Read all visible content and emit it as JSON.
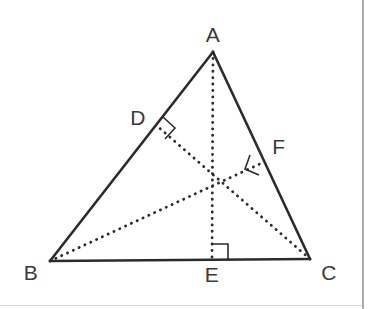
{
  "figure": {
    "background_color": "#ffffff",
    "stroke_color": "#2b2b2b",
    "label_color": "#3a3a3a",
    "border_color": "#8a8a8a"
  },
  "points": {
    "A": {
      "label": "A",
      "x": 213,
      "y": 52,
      "label_x": 213,
      "label_y": 34
    },
    "B": {
      "label": "B",
      "x": 50,
      "y": 261,
      "label_x": 31,
      "label_y": 272
    },
    "C": {
      "label": "C",
      "x": 310,
      "y": 259,
      "label_x": 329,
      "label_y": 272
    },
    "D": {
      "label": "D",
      "x": 156,
      "y": 125,
      "label_x": 138,
      "label_y": 117
    },
    "E": {
      "label": "E",
      "x": 212,
      "y": 260,
      "label_x": 212,
      "label_y": 274
    },
    "F": {
      "label": "F",
      "x": 264,
      "y": 162,
      "label_x": 279,
      "label_y": 146
    },
    "H": {
      "label": "",
      "x": 212,
      "y": 176
    }
  },
  "sides": [
    {
      "name": "side-AB",
      "from": "A",
      "to": "B",
      "style": "solid"
    },
    {
      "name": "side-AC",
      "from": "A",
      "to": "C",
      "style": "solid"
    },
    {
      "name": "side-BC",
      "from": "B",
      "to": "C",
      "style": "solid"
    }
  ],
  "altitudes": [
    {
      "name": "altitude-A-to-E",
      "from": "A",
      "to": "E",
      "style": "dotted",
      "foot": "E"
    },
    {
      "name": "altitude-B-to-F",
      "from": "B",
      "to": "F",
      "style": "dotted",
      "foot": "F"
    },
    {
      "name": "altitude-C-to-D",
      "from": "C",
      "to": "D",
      "style": "dotted",
      "foot": "D"
    }
  ],
  "right_angles": [
    {
      "name": "right-angle-at-D",
      "at": "D",
      "size": 14
    },
    {
      "name": "right-angle-at-E",
      "at": "E",
      "size": 15
    },
    {
      "name": "right-angle-at-F",
      "at": "F",
      "size": 14
    }
  ],
  "page_border": {
    "vertical_rule_x": 363,
    "horizontal_rule_y": 305
  }
}
